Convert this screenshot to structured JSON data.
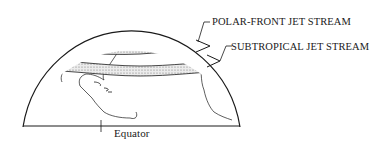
{
  "diagram": {
    "labels": {
      "polar_front": "POLAR-FRONT JET STREAM",
      "subtropical": "SUBTROPICAL JET STREAM",
      "equator": "Equator"
    },
    "colors": {
      "line": "#1a1a1a",
      "band_fill": "#e4e4e4",
      "background": "#ffffff"
    }
  }
}
